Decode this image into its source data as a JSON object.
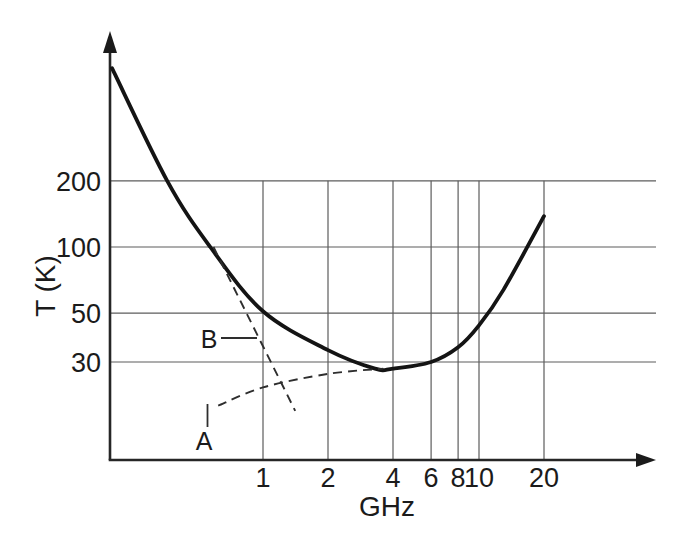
{
  "figure": {
    "background": "#ffffff",
    "ink_color": "#1b1b1b",
    "grid_color": "#5c5c5c"
  },
  "chart_data": {
    "type": "line",
    "title": "",
    "xlabel": "GHz",
    "ylabel": "T (K)",
    "x_scale": "log",
    "y_scale": "log",
    "x_ticks": [
      1,
      2,
      4,
      6,
      8,
      10,
      20
    ],
    "y_ticks": [
      200,
      100,
      50,
      30
    ],
    "x_range_ghz": [
      0.2,
      30
    ],
    "y_range_k": [
      15,
      700
    ],
    "grid": true,
    "legend_position": "none",
    "series": [
      {
        "name": "total-noise-temperature",
        "style": "solid",
        "points_ghz_k": [
          [
            0.2,
            650
          ],
          [
            0.36,
            200
          ],
          [
            0.57,
            100
          ],
          [
            1,
            51
          ],
          [
            2,
            34
          ],
          [
            3.3,
            28
          ],
          [
            4,
            28
          ],
          [
            6,
            30
          ],
          [
            8,
            35
          ],
          [
            10,
            44
          ],
          [
            13,
            64
          ],
          [
            20,
            138
          ]
        ]
      },
      {
        "name": "B",
        "style": "dashed",
        "points_ghz_k": [
          [
            0.59,
            100
          ],
          [
            1.41,
            18
          ]
        ]
      },
      {
        "name": "A",
        "style": "dashed",
        "points_ghz_k": [
          [
            0.62,
            19
          ],
          [
            1,
            23
          ],
          [
            2,
            26.5
          ],
          [
            3.6,
            28
          ]
        ]
      }
    ],
    "annotations": [
      {
        "text": "B"
      },
      {
        "text": "A"
      }
    ]
  }
}
